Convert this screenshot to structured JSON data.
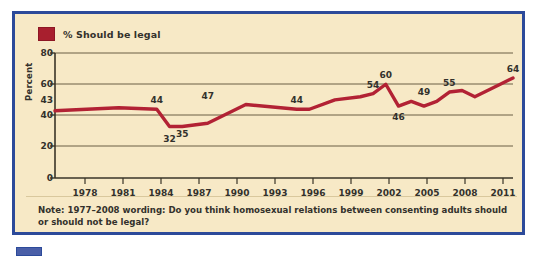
{
  "card": {
    "border_color": "#2c4a9a",
    "background_color": "#f7e9c6"
  },
  "legend": {
    "label": "% Should be legal",
    "swatch_color": "#a81f2e"
  },
  "note": {
    "text": "Note: 1977–2008 wording: Do you think homosexual relations between consenting adults should or should not be legal?"
  },
  "chart_data": {
    "type": "line",
    "title": "",
    "subtitle": "",
    "xlabel": "",
    "ylabel": "Percent",
    "ylim": [
      0,
      80
    ],
    "xlim": [
      1977,
      2013
    ],
    "grid": true,
    "legend_position": "top-left",
    "series": [
      {
        "name": "% Should be legal",
        "color": "#b22234",
        "x": [
          1977,
          1982,
          1985,
          1986,
          1987,
          1989,
          1992,
          1996,
          1997,
          1999,
          2001,
          2002,
          2003,
          2004,
          2005,
          2006,
          2007,
          2008,
          2009,
          2010,
          2011,
          2012,
          2013
        ],
        "values": [
          43,
          45,
          44,
          33,
          33,
          35,
          47,
          44,
          44,
          50,
          52,
          54,
          60,
          46,
          49,
          46,
          49,
          55,
          56,
          52,
          56,
          60,
          64
        ]
      }
    ],
    "yticks": [
      0,
      20,
      40,
      60,
      80
    ],
    "yticklabels": [
      "0",
      "20",
      "40",
      "60",
      "80"
    ],
    "y_special_tick": {
      "value": 43,
      "label": "43"
    },
    "xticks": [
      1978,
      1981,
      1984,
      1987,
      1990,
      1993,
      1996,
      1999,
      2002,
      2005,
      2008,
      2011
    ],
    "xticklabels": [
      "1978",
      "1981",
      "1984",
      "1987",
      "1990",
      "1993",
      "1996",
      "1999",
      "2002",
      "2005",
      "2008",
      "2011"
    ],
    "annotations": [
      {
        "label": "44",
        "x": 1985,
        "y": 44,
        "position": "above"
      },
      {
        "label": "32",
        "x": 1986,
        "y": 32,
        "position": "below"
      },
      {
        "label": "35",
        "x": 1987,
        "y": 35,
        "position": "below"
      },
      {
        "label": "47",
        "x": 1989,
        "y": 47,
        "position": "above"
      },
      {
        "label": "44",
        "x": 1996,
        "y": 44,
        "position": "above"
      },
      {
        "label": "54",
        "x": 2002,
        "y": 54,
        "position": "above"
      },
      {
        "label": "60",
        "x": 2003,
        "y": 60,
        "position": "above"
      },
      {
        "label": "46",
        "x": 2004,
        "y": 46,
        "position": "below"
      },
      {
        "label": "49",
        "x": 2006,
        "y": 49,
        "position": "above"
      },
      {
        "label": "55",
        "x": 2008,
        "y": 55,
        "position": "above"
      },
      {
        "label": "64",
        "x": 2013,
        "y": 64,
        "position": "above"
      }
    ]
  }
}
